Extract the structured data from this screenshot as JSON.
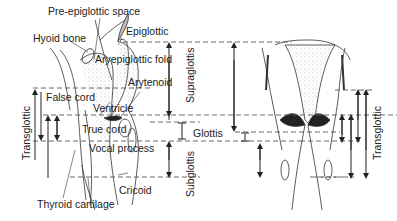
{
  "labels": {
    "pre_epiglottic_space": "Pre-epiglottic space",
    "hyoid_bone": "Hyoid bone",
    "epiglottic": "Epiglottic",
    "aryepiglottic_fold": "Aryepiglottic fold",
    "arytenoid": "Arytenoid",
    "false_cord": "False cord",
    "ventricle": "Ventricle",
    "true_cord": "True cord",
    "vocal_process": "Vocal process",
    "cricoid": "Cricoid",
    "thyroid_cartilage": "Thyroid cartilage"
  },
  "regions": {
    "supraglottis": "Supraglottis",
    "glottis": "Glottis",
    "subglottis": "Subglottis",
    "transglottic_left": "Transglottic",
    "transglottic_right": "Transglottic"
  },
  "colors": {
    "ink": "#222222",
    "shade": "#9a9a9a",
    "background": "#ffffff"
  }
}
